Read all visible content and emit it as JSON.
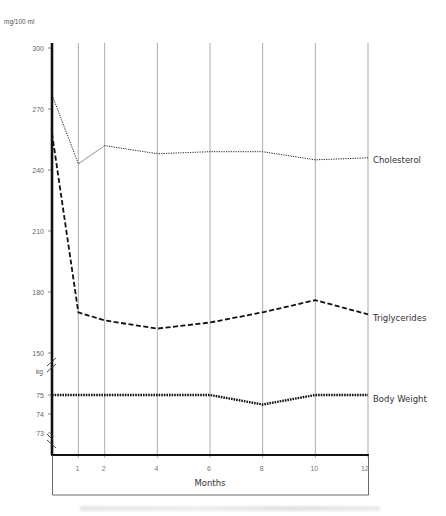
{
  "chart_data": {
    "type": "line",
    "title": "",
    "xlabel": "Months",
    "ylabel_upper": "mg/100 ml",
    "ylabel_lower": "kg",
    "x": [
      0,
      1,
      2,
      4,
      6,
      8,
      10,
      12
    ],
    "x_tick_labels": [
      "1",
      "2",
      "4",
      "6",
      "8",
      "10",
      "12"
    ],
    "y_upper_ticks": [
      "300",
      "270",
      "240",
      "210",
      "180",
      "150"
    ],
    "y_lower_ticks": [
      "75",
      "74",
      "73"
    ],
    "ylim_upper": [
      150,
      300
    ],
    "ylim_lower": [
      73,
      75
    ],
    "grid": "vertical lines at each month tick",
    "axis_break": true,
    "series": [
      {
        "name": "Cholesterol",
        "axis": "mg/100 ml",
        "style": "dotted",
        "values": [
          277,
          243,
          252,
          248,
          249,
          249,
          245,
          246
        ]
      },
      {
        "name": "Triglycerides",
        "axis": "mg/100 ml",
        "style": "dashed",
        "values": [
          258,
          170,
          166,
          162,
          165,
          170,
          176,
          169
        ]
      },
      {
        "name": "Body Weight",
        "axis": "kg",
        "style": "heavy dotted",
        "values": [
          75,
          75,
          75,
          75,
          75,
          74.5,
          75,
          75
        ]
      }
    ]
  },
  "labels": {
    "unit_mg": "mg/100 ml",
    "unit_kg": "kg",
    "x_title": "Months",
    "cholesterol": "Cholesterol",
    "triglycerides": "Triglycerides",
    "body_weight": "Body Weight"
  }
}
